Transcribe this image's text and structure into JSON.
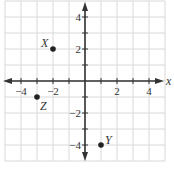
{
  "chart_data": {
    "type": "scatter",
    "title": "",
    "xlabel": "x",
    "ylabel": "",
    "xlim": [
      -5,
      5
    ],
    "ylim": [
      -5,
      5
    ],
    "grid": true,
    "x_ticks": [
      -4,
      -2,
      2,
      4
    ],
    "y_ticks": [
      4,
      2,
      -2,
      -4
    ],
    "x_tick_labels": [
      "−4",
      "−2",
      "2",
      "4"
    ],
    "y_tick_labels": [
      "4",
      "2",
      "−2",
      "−4"
    ],
    "points": [
      {
        "label": "X",
        "x": -2,
        "y": 2
      },
      {
        "label": "Y",
        "x": 1,
        "y": -4
      },
      {
        "label": "Z",
        "x": -3,
        "y": -1
      }
    ]
  }
}
